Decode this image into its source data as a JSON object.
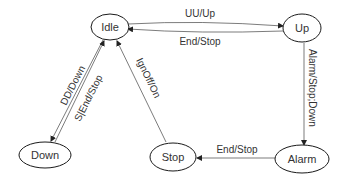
{
  "diagram": {
    "type": "state-machine",
    "states": [
      {
        "id": "idle",
        "label": "Idle"
      },
      {
        "id": "up",
        "label": "Up"
      },
      {
        "id": "down",
        "label": "Down"
      },
      {
        "id": "stop",
        "label": "Stop"
      },
      {
        "id": "alarm",
        "label": "Alarm"
      }
    ],
    "transitions": [
      {
        "from": "idle",
        "to": "up",
        "label": "UU/Up"
      },
      {
        "from": "up",
        "to": "idle",
        "label": "End/Stop"
      },
      {
        "from": "idle",
        "to": "down",
        "label": "DD/Down"
      },
      {
        "from": "down",
        "to": "idle",
        "label": "S|End/Stop"
      },
      {
        "from": "stop",
        "to": "idle",
        "label": "IgnOff/On"
      },
      {
        "from": "up",
        "to": "alarm",
        "label": "Alarm/Stop;Down"
      },
      {
        "from": "alarm",
        "to": "stop",
        "label": "End/Stop"
      }
    ]
  }
}
